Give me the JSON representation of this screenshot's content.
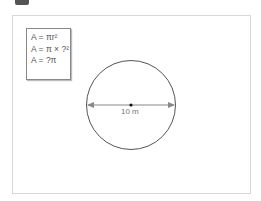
{
  "formulas": {
    "line1": "A = πr²",
    "line2": "A = π × ?²",
    "line3": "A = ?π"
  },
  "circle": {
    "diameter_label": "10 m",
    "stroke_color": "#555555",
    "dimension_color": "#777777"
  }
}
